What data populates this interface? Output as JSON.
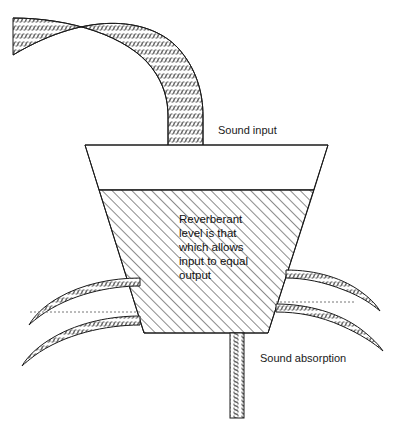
{
  "diagram": {
    "canvas": {
      "width": 404,
      "height": 422,
      "background": "#ffffff"
    },
    "colors": {
      "stroke": "#1a1a1a",
      "text": "#111111",
      "dotted": "#777777",
      "fill": "#ffffff"
    },
    "labels": {
      "sound_input": "Sound input",
      "sound_absorption": "Sound absorption"
    },
    "body_text": {
      "lines": [
        "Reverberant",
        "level is that",
        "which allows",
        "input to equal",
        "output"
      ],
      "line_0": "Reverberant",
      "line_1": "level is that",
      "line_2": "which allows",
      "line_3": "input to equal",
      "line_4": "output"
    },
    "parts": {
      "input_pipe": "curved textured pipe entering vessel from upper left",
      "vessel": "truncated cone / funnel container",
      "reverberant_fill": "hatched region representing reverberant sound level",
      "absorption_bands_left": "two curved textured bands leaving vessel to the left",
      "absorption_bands_right": "two curved textured bands leaving vessel to the right",
      "drain_pipe": "vertical textured pipe leaving bottom of vessel"
    },
    "geometry": {
      "vessel_top_y": 145,
      "vessel_top_left_x": 85,
      "vessel_top_right_x": 328,
      "vessel_bottom_y": 333,
      "vessel_bottom_left_x": 144,
      "vessel_bottom_right_x": 268,
      "level_y": 190,
      "input_pipe_width": 35,
      "drain_pipe_left_x": 230,
      "drain_pipe_right_x": 244,
      "drain_pipe_bottom_y": 418
    }
  }
}
